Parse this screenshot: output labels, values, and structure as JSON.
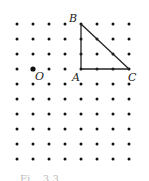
{
  "grid": {
    "columns": 8,
    "rows": 10,
    "dot_color": "#111111"
  },
  "line_color": "#222222",
  "points": [
    {
      "name": "B",
      "col": 5,
      "row": 1
    },
    {
      "name": "A",
      "col": 5,
      "row": 4
    },
    {
      "name": "C",
      "col": 8,
      "row": 4
    },
    {
      "name": "O",
      "col": 2,
      "row": 4,
      "emphasized": true
    }
  ],
  "triangle": [
    "A",
    "B",
    "C"
  ],
  "labels": {
    "B": "B",
    "A": "A",
    "C": "C",
    "O": "O"
  },
  "caption": "Fi... 3.3"
}
